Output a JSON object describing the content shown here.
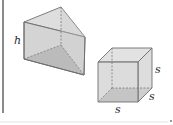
{
  "figure": {
    "colors": {
      "background": "#ffffff",
      "left_rule": "#8a8a8a",
      "edge": "#6f6f6f",
      "hidden_edge": "#7a7a7a",
      "face_light": "#d9d9d9",
      "face_mid": "#c6c6c6",
      "face_dark": "#a9a9a9",
      "bottom_rule": "#e4e4e4"
    },
    "prism": {
      "label_height": "h"
    },
    "cube": {
      "label_right": "s",
      "label_depth": "s",
      "label_bottom": "s"
    }
  }
}
